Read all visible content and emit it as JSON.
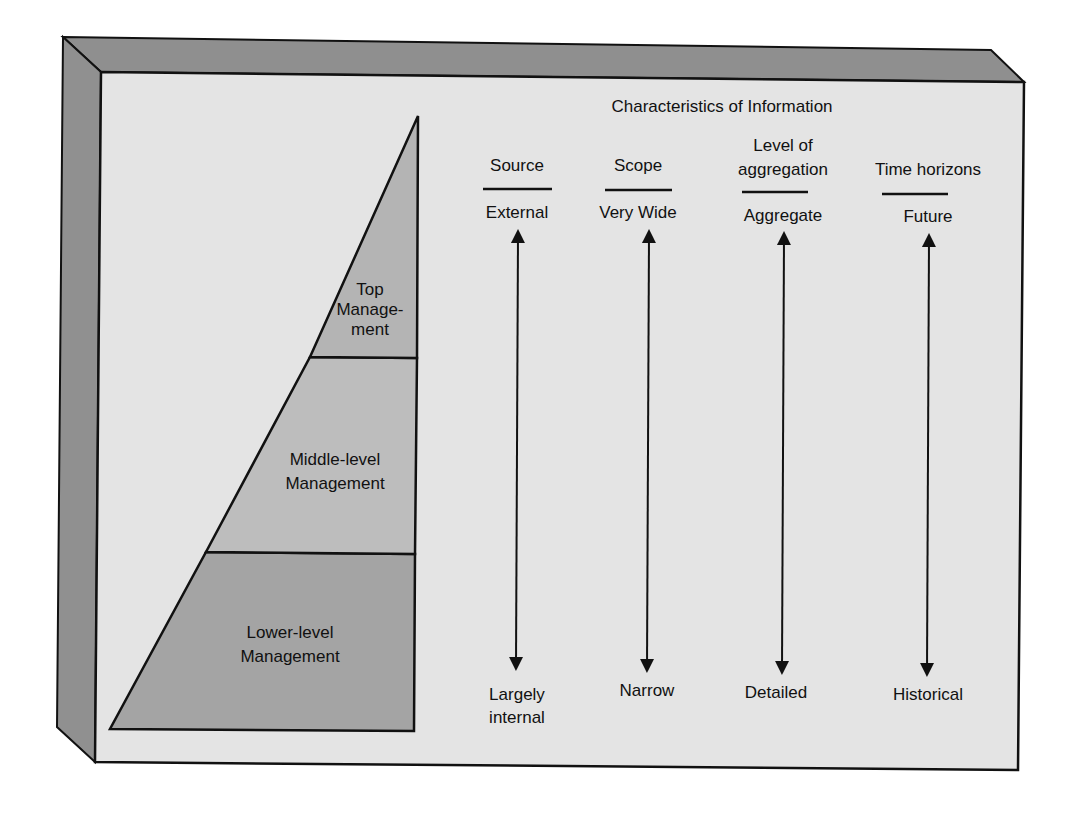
{
  "figure": {
    "title": "Characteristics of Information",
    "colors": {
      "frame_bevel": "#8f8f8f",
      "panel_background": "#e4e4e4",
      "top_management": "#b4b4b4",
      "middle_management": "#bdbdbd",
      "lower_management": "#a4a4a4",
      "lines": "#111111"
    }
  },
  "pyramid": {
    "levels": [
      {
        "id": "top",
        "label_lines": [
          "Top",
          "Manage-",
          "ment"
        ]
      },
      {
        "id": "middle",
        "label_lines": [
          "Middle-level",
          "Management"
        ]
      },
      {
        "id": "lower",
        "label_lines": [
          "Lower-level",
          "Management"
        ]
      }
    ]
  },
  "characteristics": [
    {
      "header_lines": [
        "Source"
      ],
      "top_value": "External",
      "bottom_value_lines": [
        "Largely",
        "internal"
      ]
    },
    {
      "header_lines": [
        "Scope"
      ],
      "top_value": "Very Wide",
      "bottom_value_lines": [
        "Narrow"
      ]
    },
    {
      "header_lines": [
        "Level of",
        "aggregation"
      ],
      "top_value": "Aggregate",
      "bottom_value_lines": [
        "Detailed"
      ]
    },
    {
      "header_lines": [
        "Time horizons"
      ],
      "top_value": "Future",
      "bottom_value_lines": [
        "Historical"
      ]
    }
  ]
}
